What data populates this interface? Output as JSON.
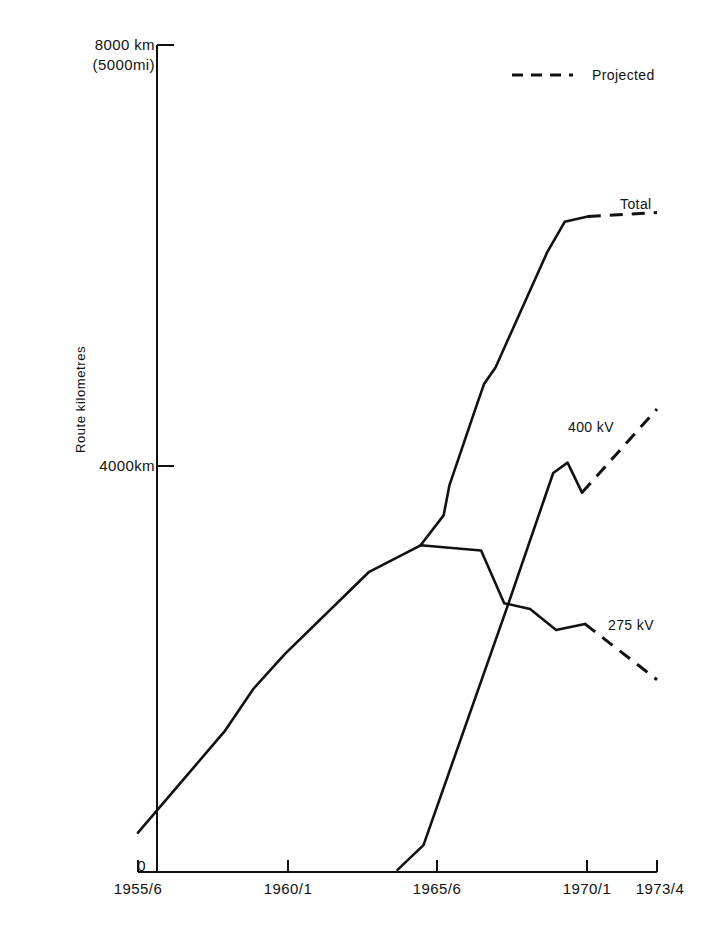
{
  "chart_data": {
    "type": "line",
    "title": "",
    "subtitle": "",
    "xlabel": "",
    "ylabel": "Route kilometres",
    "xlim": [
      1955,
      1974
    ],
    "ylim": [
      0,
      8000
    ],
    "grid": false,
    "legend_position": "top-right",
    "x_tick_labels": [
      "1955/6",
      "1960/1",
      "1965/6",
      "1970/1",
      "1973/4"
    ],
    "x_tick_values": [
      1955,
      1960,
      1965,
      1970,
      1973
    ],
    "y_tick_labels": [
      "0",
      "4000km",
      "8000 km\n(5000mi)"
    ],
    "y_tick_values": [
      0,
      4000,
      8000
    ],
    "y_axis_top_label_line1": "8000 km",
    "y_axis_top_label_line2": "(5000mi)",
    "y_axis_mid_label": "4000km",
    "y_axis_zero_label": "0",
    "legend": [
      {
        "name": "Projected",
        "style": "dashed"
      }
    ],
    "annotations": [
      {
        "text": "Total",
        "x": 1971.2,
        "y": 6350
      },
      {
        "text": "400 kV",
        "x": 1970.0,
        "y": 4400
      },
      {
        "text": "275 kV",
        "x": 1971.6,
        "y": 2520
      },
      {
        "text": "Projected",
        "x": 1968.5,
        "y": 7650
      }
    ],
    "series": [
      {
        "name": "275 kV",
        "style": "solid-then-dashed",
        "solid_points": [
          {
            "x": 1955.0,
            "y": 380
          },
          {
            "x": 1958.0,
            "y": 1360
          },
          {
            "x": 1959.0,
            "y": 1770
          },
          {
            "x": 1960.1,
            "y": 2110
          },
          {
            "x": 1963.0,
            "y": 2900
          },
          {
            "x": 1964.8,
            "y": 3160
          },
          {
            "x": 1966.9,
            "y": 3110
          },
          {
            "x": 1967.7,
            "y": 2600
          },
          {
            "x": 1968.6,
            "y": 2545
          },
          {
            "x": 1969.5,
            "y": 2340
          },
          {
            "x": 1970.5,
            "y": 2400
          }
        ],
        "dashed_points": [
          {
            "x": 1970.5,
            "y": 2400
          },
          {
            "x": 1973.0,
            "y": 1860
          }
        ]
      },
      {
        "name": "400 kV",
        "style": "solid-then-dashed",
        "solid_points": [
          {
            "x": 1964.0,
            "y": 20
          },
          {
            "x": 1964.9,
            "y": 260
          },
          {
            "x": 1967.8,
            "y": 2560
          },
          {
            "x": 1969.4,
            "y": 3860
          },
          {
            "x": 1969.9,
            "y": 3960
          },
          {
            "x": 1970.4,
            "y": 3670
          }
        ],
        "dashed_points": [
          {
            "x": 1970.4,
            "y": 3670
          },
          {
            "x": 1973.0,
            "y": 4480
          }
        ]
      },
      {
        "name": "Total",
        "style": "solid-then-dashed",
        "solid_points": [
          {
            "x": 1964.8,
            "y": 3160
          },
          {
            "x": 1965.6,
            "y": 3450
          },
          {
            "x": 1965.8,
            "y": 3740
          },
          {
            "x": 1966.7,
            "y": 4480
          },
          {
            "x": 1967.0,
            "y": 4720
          },
          {
            "x": 1967.4,
            "y": 4880
          },
          {
            "x": 1969.2,
            "y": 6000
          },
          {
            "x": 1969.8,
            "y": 6290
          },
          {
            "x": 1970.6,
            "y": 6340
          }
        ],
        "dashed_points": [
          {
            "x": 1970.6,
            "y": 6340
          },
          {
            "x": 1973.0,
            "y": 6380
          }
        ]
      }
    ]
  },
  "axes": {
    "y_title": "Route kilometres",
    "y_top_line1": "8000 km",
    "y_top_line2": "(5000mi)",
    "y_mid": "4000km",
    "y_zero": "0",
    "x_ticks": [
      "1955/6",
      "1960/1",
      "1965/6",
      "1970/1",
      "1973/4"
    ]
  },
  "labels": {
    "total": "Total",
    "kv400": "400 kV",
    "kv275": "275 kV",
    "projected": "Projected"
  },
  "colors": {
    "line": "#111111",
    "axis": "#111111",
    "background": "#ffffff"
  }
}
